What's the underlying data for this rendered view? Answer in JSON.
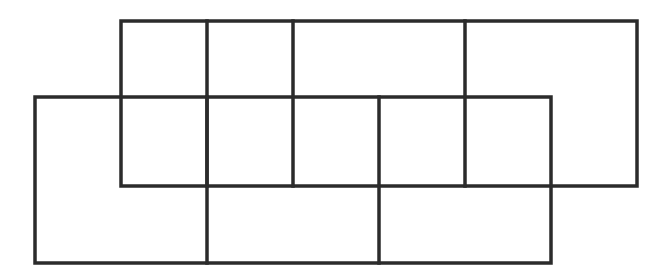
{
  "diagram": {
    "width": 670,
    "height": 278,
    "stroke_color": "#2b2b2b",
    "stroke_width": 3.5,
    "background": "#ffffff",
    "rectangles": [
      {
        "id": "top-rect",
        "x1": 121,
        "y1": 21,
        "x2": 637,
        "y2": 186
      },
      {
        "id": "bottom-rect",
        "x1": 35,
        "y1": 97,
        "x2": 551,
        "y2": 263
      }
    ],
    "lines": [
      {
        "id": "top-divider-1",
        "x1": 207,
        "y1": 21,
        "x2": 207,
        "y2": 186
      },
      {
        "id": "top-divider-2",
        "x1": 293,
        "y1": 21,
        "x2": 293,
        "y2": 186
      },
      {
        "id": "top-divider-3",
        "x1": 465,
        "y1": 21,
        "x2": 465,
        "y2": 186
      },
      {
        "id": "bottom-divider-1",
        "x1": 207,
        "y1": 97,
        "x2": 207,
        "y2": 263
      },
      {
        "id": "bottom-divider-2",
        "x1": 379,
        "y1": 97,
        "x2": 379,
        "y2": 263
      }
    ]
  }
}
